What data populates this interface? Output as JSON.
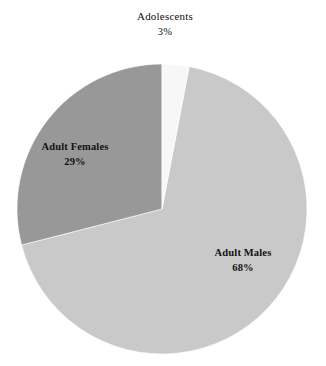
{
  "chart_data": {
    "type": "pie",
    "title": "",
    "xlabel": "",
    "ylabel": "",
    "legend": "none",
    "grid": false,
    "background_color": "#ffffff",
    "categories": [
      "Adult Males",
      "Adult Females",
      "Adolescents"
    ],
    "values": [
      68,
      29,
      3
    ],
    "value_suffix": "%",
    "slices": [
      {
        "label": "Adult Males",
        "value": 68,
        "value_label": "68%",
        "color": "#c9c9c9",
        "start_angle": 10.8,
        "end_angle": 255.6,
        "label_position": "inside",
        "label_x": 243,
        "label_y": 252
      },
      {
        "label": "Adult Females",
        "value": 29,
        "value_label": "29%",
        "color": "#989898",
        "start_angle": 255.6,
        "end_angle": 360.0,
        "label_position": "inside",
        "label_x": 75,
        "label_y": 146
      },
      {
        "label": "Adolescents",
        "value": 3,
        "value_label": "3%",
        "color": "#f7f7f7",
        "start_angle": 0.0,
        "end_angle": 10.8,
        "label_position": "outside-top",
        "label_x": 165,
        "label_y": 16
      }
    ],
    "geometry": {
      "center_x": 162,
      "center_y": 209,
      "radius": 145
    }
  }
}
